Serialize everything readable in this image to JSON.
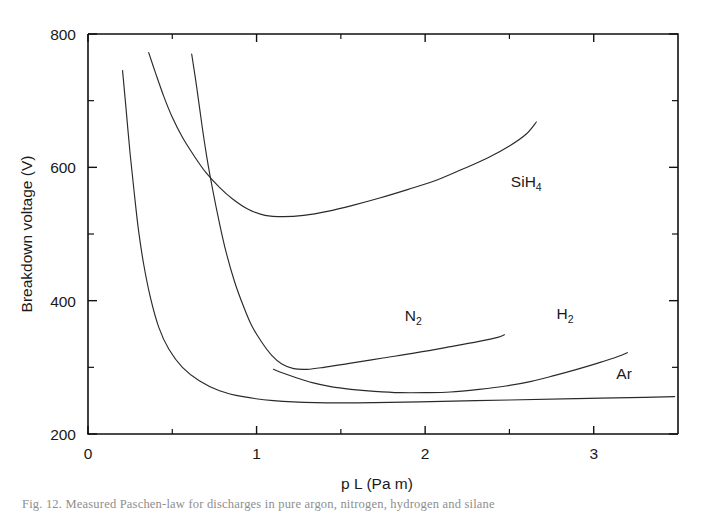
{
  "figure": {
    "caption": "Fig. 12.   Measured Paschen-law for discharges in pure argon, nitrogen, hydrogen and silane"
  },
  "chart_data": {
    "type": "line",
    "title": "",
    "xlabel": "p L (Pa m)",
    "ylabel": "Breakdown voltage (V)",
    "xlim": [
      0,
      3.5
    ],
    "ylim": [
      200,
      800
    ],
    "xticks": [
      0,
      1,
      2,
      3
    ],
    "xticklabels": [
      "0",
      "1",
      "2",
      "3"
    ],
    "xticks_minor": [
      0.5,
      1.5,
      2.5,
      3.5
    ],
    "yticks": [
      200,
      400,
      600,
      800
    ],
    "yticklabels": [
      "200",
      "400",
      "600",
      "800"
    ],
    "yticks_minor": [
      300,
      500,
      700
    ],
    "grid": false,
    "legend": "inline-annotations",
    "series": [
      {
        "name": "Ar",
        "label": "Ar",
        "label_x": 3.18,
        "label_y": 283,
        "minimum": {
          "x": 1.55,
          "y": 248
        },
        "points": [
          [
            0.205,
            745
          ],
          [
            0.225,
            690
          ],
          [
            0.25,
            620
          ],
          [
            0.275,
            560
          ],
          [
            0.3,
            505
          ],
          [
            0.33,
            455
          ],
          [
            0.37,
            405
          ],
          [
            0.42,
            360
          ],
          [
            0.48,
            327
          ],
          [
            0.56,
            300
          ],
          [
            0.66,
            280
          ],
          [
            0.78,
            265
          ],
          [
            0.92,
            256
          ],
          [
            1.1,
            250
          ],
          [
            1.35,
            247
          ],
          [
            1.7,
            247
          ],
          [
            2.1,
            249
          ],
          [
            2.5,
            251
          ],
          [
            2.9,
            253
          ],
          [
            3.3,
            255
          ],
          [
            3.48,
            256
          ]
        ]
      },
      {
        "name": "SiH4",
        "label": "SiH4",
        "label_x": 2.6,
        "label_y": 570,
        "minimum": {
          "x": 1.05,
          "y": 527
        },
        "points": [
          [
            0.36,
            772
          ],
          [
            0.4,
            742
          ],
          [
            0.45,
            706
          ],
          [
            0.5,
            675
          ],
          [
            0.56,
            645
          ],
          [
            0.63,
            617
          ],
          [
            0.7,
            592
          ],
          [
            0.78,
            570
          ],
          [
            0.86,
            552
          ],
          [
            0.95,
            537
          ],
          [
            1.05,
            528
          ],
          [
            1.16,
            526
          ],
          [
            1.28,
            528
          ],
          [
            1.42,
            534
          ],
          [
            1.57,
            543
          ],
          [
            1.73,
            554
          ],
          [
            1.9,
            567
          ],
          [
            2.07,
            581
          ],
          [
            2.22,
            597
          ],
          [
            2.37,
            614
          ],
          [
            2.5,
            632
          ],
          [
            2.6,
            650
          ],
          [
            2.66,
            668
          ]
        ]
      },
      {
        "name": "N2",
        "label": "N2",
        "label_x": 1.93,
        "label_y": 370,
        "minimum": {
          "x": 1.2,
          "y": 297
        },
        "points": [
          [
            0.615,
            770
          ],
          [
            0.645,
            720
          ],
          [
            0.675,
            665
          ],
          [
            0.705,
            615
          ],
          [
            0.74,
            566
          ],
          [
            0.78,
            516
          ],
          [
            0.82,
            472
          ],
          [
            0.87,
            428
          ],
          [
            0.92,
            393
          ],
          [
            0.97,
            363
          ],
          [
            1.03,
            338
          ],
          [
            1.09,
            318
          ],
          [
            1.15,
            305
          ],
          [
            1.22,
            298
          ],
          [
            1.3,
            297
          ],
          [
            1.4,
            300
          ],
          [
            1.55,
            306
          ],
          [
            1.75,
            314
          ],
          [
            1.95,
            322
          ],
          [
            2.15,
            331
          ],
          [
            2.32,
            339
          ],
          [
            2.43,
            345
          ],
          [
            2.47,
            349
          ]
        ]
      },
      {
        "name": "H2",
        "label": "H2",
        "label_x": 2.83,
        "label_y": 372,
        "minimum": {
          "x": 2.03,
          "y": 262
        },
        "points": [
          [
            1.1,
            297
          ],
          [
            1.16,
            291
          ],
          [
            1.24,
            284
          ],
          [
            1.33,
            277
          ],
          [
            1.44,
            271
          ],
          [
            1.56,
            267
          ],
          [
            1.7,
            264
          ],
          [
            1.85,
            262
          ],
          [
            2.0,
            262
          ],
          [
            2.15,
            263
          ],
          [
            2.32,
            267
          ],
          [
            2.48,
            272
          ],
          [
            2.63,
            279
          ],
          [
            2.77,
            288
          ],
          [
            2.9,
            297
          ],
          [
            3.02,
            306
          ],
          [
            3.12,
            314
          ],
          [
            3.2,
            322
          ]
        ]
      }
    ]
  },
  "labels": {
    "tick_0": "0",
    "tick_1": "1",
    "tick_2": "2",
    "tick_3": "3",
    "tick_200": "200",
    "tick_400": "400",
    "tick_600": "600",
    "tick_800": "800"
  }
}
